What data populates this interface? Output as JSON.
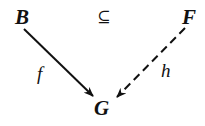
{
  "diagram": {
    "nodes": {
      "B": {
        "label": "B"
      },
      "F": {
        "label": "F"
      },
      "G": {
        "label": "G"
      }
    },
    "relation": {
      "symbol": "⊆"
    },
    "edges": {
      "f": {
        "label": "f",
        "from": "B",
        "to": "G",
        "style": "solid"
      },
      "h": {
        "label": "h",
        "from": "F",
        "to": "G",
        "style": "dashed"
      }
    }
  }
}
